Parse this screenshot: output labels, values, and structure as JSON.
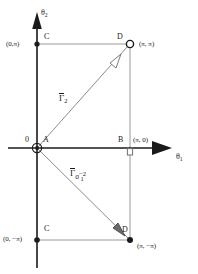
{
  "figure": {
    "type": "mathematical-diagram"
  },
  "axes": {
    "x_label": "θ",
    "x_label_sub": "1",
    "y_label": "θ",
    "y_label_sub": "2"
  },
  "points": [
    {
      "id": "origin-zero",
      "label": "0",
      "marker": "none"
    },
    {
      "id": "point-a",
      "label": "A",
      "marker": "circled-dot",
      "coord": "(0, 0)"
    },
    {
      "id": "point-b",
      "label": "B",
      "marker": "open-square",
      "coord": "(π, 0)"
    },
    {
      "id": "point-c-top",
      "label": "C",
      "marker": "filled-dot",
      "coord": "(0,π)"
    },
    {
      "id": "point-d-top",
      "label": "D",
      "marker": "open-circle",
      "coord": "(π, π)"
    },
    {
      "id": "point-c-bottom",
      "label": "C",
      "marker": "filled-dot",
      "coord": "(0, −π)"
    },
    {
      "id": "point-d-bottom",
      "label": "D",
      "marker": "filled-dot",
      "coord": "(π, −π)"
    }
  ],
  "coords": {
    "top_left": "(0,π)",
    "top_right": "(π, π)",
    "mid_right": "(π, 0)",
    "bottom_left": "(0, −π)",
    "bottom_right": "(π, −π)",
    "origin": "0"
  },
  "curves": [
    {
      "id": "curve-gamma-2",
      "symbol": "Γ",
      "sub": "2",
      "overline": true,
      "from": "A",
      "to": "D",
      "direction": "up-right"
    },
    {
      "id": "curve-gamma-1-sigma",
      "symbol": "Γ",
      "sub_sigma": "σ",
      "sub_one": "1",
      "sup": "−2",
      "overline": true,
      "from": "A",
      "to": "D",
      "direction": "down-right"
    }
  ],
  "labels": {
    "point_a": "A",
    "point_b": "B",
    "point_c_top": "C",
    "point_c_bottom": "C",
    "point_d_top": "D",
    "point_d_bottom": "D",
    "origin": "0",
    "gamma": "Γ",
    "gamma2_sub": "2",
    "sigma": "σ",
    "sigma_sup": "−2",
    "sigma_sub": "1",
    "theta": "θ",
    "theta1_sub": "1",
    "theta2_sub": "2"
  },
  "colors": {
    "background": "#ffffff",
    "axis": "#1b1b1b",
    "rectangle": "#9a9a9a",
    "curve": "#8c8c8c",
    "text": "#1b1b1b"
  }
}
